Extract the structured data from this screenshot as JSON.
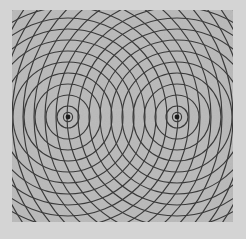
{
  "figure": {
    "kind": "ripple-tank-wavefront-diagram",
    "canvas": {
      "width": 246,
      "height": 239
    },
    "background": {
      "outer_margin_color": "#d4d4d4",
      "panel_color": "#b9b9b9",
      "panel_noise": true,
      "panel_noise_opacity": 0.1
    },
    "panel": {
      "x": 12,
      "y": 10,
      "width": 221,
      "height": 212
    },
    "wave": {
      "stroke_color": "#3a3a3a",
      "stroke_width": 1.15,
      "ring_spacing": 11,
      "ring_count": 13,
      "first_ring_radius": 11
    },
    "sources": [
      {
        "name": "left-source",
        "label": "S1",
        "cx": 68,
        "cy": 117,
        "dot_radius": 2.4,
        "dot_color": "#1a1a1a",
        "inner_halo_radius": 4.6
      },
      {
        "name": "right-source",
        "label": "S2",
        "cx": 177,
        "cy": 117,
        "dot_radius": 2.4,
        "dot_color": "#1a1a1a",
        "inner_halo_radius": 4.6
      }
    ],
    "caption": "",
    "alt_text": "Grey square panel showing two sets of concentric dark circles radiating from two point sources located left and right of centre on the same horizontal line, overlapping to produce an interference pattern."
  }
}
